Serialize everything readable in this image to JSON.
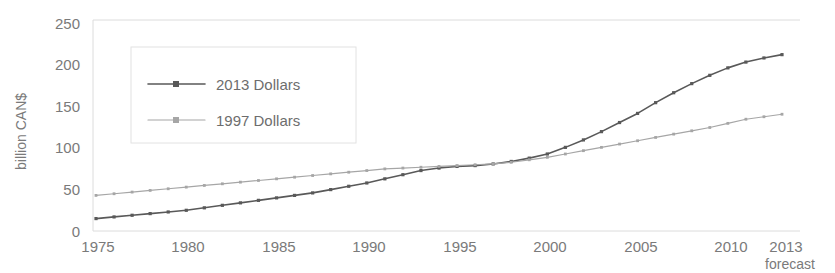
{
  "chart_data": {
    "type": "line",
    "title": "",
    "xlabel": "",
    "ylabel": "billion CAN$",
    "xlim": [
      1975,
      2013
    ],
    "ylim": [
      0,
      250
    ],
    "ytick_labels": [
      "0",
      "50",
      "100",
      "150",
      "200",
      "250"
    ],
    "ytick_values": [
      0,
      50,
      100,
      150,
      200,
      250
    ],
    "xtick_labels": [
      "1975",
      "1980",
      "1985",
      "1990",
      "1995",
      "2000",
      "2005",
      "2010",
      "2013"
    ],
    "xtick_values": [
      1975,
      1980,
      1985,
      1990,
      1995,
      2000,
      2005,
      2010,
      2013
    ],
    "grid": false,
    "legend_position": "upper-left-inside",
    "annotations": [
      {
        "text": "forecast",
        "x": 2013,
        "position": "below-axis-right"
      }
    ],
    "x": [
      1975,
      1976,
      1977,
      1978,
      1979,
      1980,
      1981,
      1982,
      1983,
      1984,
      1985,
      1986,
      1987,
      1988,
      1989,
      1990,
      1991,
      1992,
      1993,
      1994,
      1995,
      1996,
      1997,
      1998,
      1999,
      2000,
      2001,
      2002,
      2003,
      2004,
      2005,
      2006,
      2007,
      2008,
      2009,
      2010,
      2011,
      2012,
      2013
    ],
    "series": [
      {
        "name": "2013 Dollars",
        "color": "#595959",
        "marker": "diamond",
        "values": [
          15,
          17,
          19,
          21,
          23,
          25,
          28,
          31,
          34,
          37,
          40,
          43,
          46,
          50,
          54,
          58,
          63,
          68,
          73,
          76,
          78,
          79,
          81,
          84,
          88,
          93,
          101,
          110,
          120,
          131,
          142,
          155,
          167,
          178,
          188,
          197,
          204,
          209,
          213
        ]
      },
      {
        "name": "1997 Dollars",
        "color": "#a6a6a6",
        "marker": "square",
        "values": [
          43,
          45,
          47,
          49,
          51,
          53,
          55,
          57,
          59,
          61,
          63,
          65,
          67,
          69,
          71,
          73,
          75,
          76,
          77,
          78,
          79,
          80,
          81,
          83,
          86,
          89,
          93,
          97,
          101,
          105,
          109,
          113,
          117,
          121,
          125,
          130,
          135,
          138,
          141
        ]
      }
    ]
  },
  "legend": {
    "items": [
      {
        "label": "2013 Dollars"
      },
      {
        "label": "1997 Dollars"
      }
    ]
  },
  "axis": {
    "y_title": "billion CAN$"
  },
  "footnote": {
    "forecast_label": "forecast"
  }
}
